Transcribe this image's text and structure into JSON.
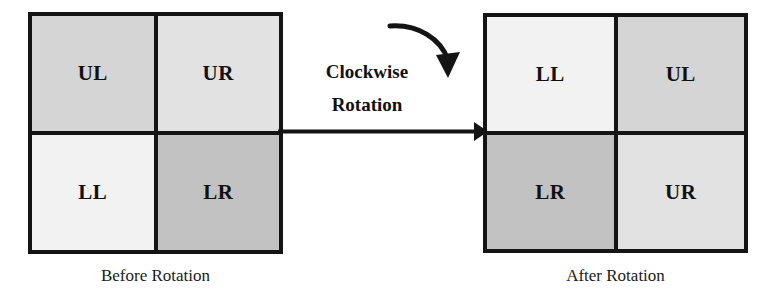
{
  "figure": {
    "rotation_label_line1": "Clockwise",
    "rotation_label_line2": "Rotation",
    "colors": {
      "ink": "#141414",
      "background": "#ffffff",
      "shade_ul": "#d5d5d5",
      "shade_ur": "#e2e2e2",
      "shade_ll": "#f2f2f2",
      "shade_lr": "#c2c2c2"
    },
    "icons": {
      "straight_arrow": "right-arrow-icon",
      "curved_arrow": "clockwise-curved-arrow-icon"
    }
  },
  "before": {
    "caption": "Before Rotation",
    "cells": [
      {
        "label": "UL",
        "position": "upper-left",
        "shade": "#d5d5d5"
      },
      {
        "label": "UR",
        "position": "upper-right",
        "shade": "#e2e2e2"
      },
      {
        "label": "LL",
        "position": "lower-left",
        "shade": "#f2f2f2"
      },
      {
        "label": "LR",
        "position": "lower-right",
        "shade": "#c2c2c2"
      }
    ]
  },
  "after": {
    "caption": "After Rotation",
    "cells": [
      {
        "label": "LL",
        "position": "upper-left",
        "shade": "#f2f2f2"
      },
      {
        "label": "UL",
        "position": "upper-right",
        "shade": "#d5d5d5"
      },
      {
        "label": "LR",
        "position": "lower-left",
        "shade": "#c2c2c2"
      },
      {
        "label": "UR",
        "position": "lower-right",
        "shade": "#e2e2e2"
      }
    ]
  }
}
